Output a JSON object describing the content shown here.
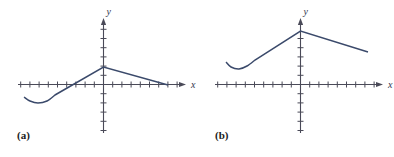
{
  "figure": {
    "background": "#ffffff",
    "curve_color": "#3b4a6b",
    "axis_color": "#4a4a58",
    "label_color": "#1b1b1b",
    "panels": [
      {
        "key": "a",
        "label": "(a)",
        "x_axis_label": "x",
        "y_axis_label": "y",
        "origin": {
          "x": 103.5,
          "y": 84.5
        },
        "tick_spacing": 9.2,
        "x_axis": {
          "start": 18,
          "end": 186,
          "arrow": true
        },
        "y_axis": {
          "start": 18,
          "end": 133,
          "arrow": true
        },
        "x_ticks_left": 9,
        "x_ticks_right": 8,
        "y_ticks_up": 7,
        "y_ticks_down": 5,
        "tick_half_length": 3,
        "curve_description": "smooth concave-up dip on the far left rising through the x-axis to a corner peak on the y-axis, then a straight gentle decline back down to the x-axis on the right",
        "curve_points": [
          {
            "x": 24,
            "y": 97
          },
          {
            "x": 30,
            "y": 101
          },
          {
            "x": 38,
            "y": 103
          },
          {
            "x": 47,
            "y": 101
          },
          {
            "x": 55,
            "y": 95
          },
          {
            "x": 103.5,
            "y": 67
          },
          {
            "x": 168,
            "y": 85
          }
        ]
      },
      {
        "key": "b",
        "label": "(b)",
        "x_axis_label": "x",
        "y_axis_label": "y",
        "origin": {
          "x": 103.5,
          "y": 84.5
        },
        "tick_spacing": 9.2,
        "x_axis": {
          "start": 18,
          "end": 186,
          "arrow": true
        },
        "y_axis": {
          "start": 18,
          "end": 133,
          "arrow": true
        },
        "x_ticks_left": 9,
        "x_ticks_right": 8,
        "y_ticks_up": 5,
        "y_ticks_down": 6,
        "tick_half_length": 3,
        "curve_description": "smooth concave-up dip on the left above the x-axis rising in a straight line to a corner peak on the y-axis, then a straight gentle decline to the right, staying above the x-axis",
        "curve_points": [
          {
            "x": 29,
            "y": 62
          },
          {
            "x": 34,
            "y": 67
          },
          {
            "x": 42,
            "y": 69
          },
          {
            "x": 50,
            "y": 66
          },
          {
            "x": 58,
            "y": 60
          },
          {
            "x": 103.5,
            "y": 31
          },
          {
            "x": 171,
            "y": 52
          }
        ]
      }
    ]
  }
}
